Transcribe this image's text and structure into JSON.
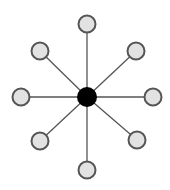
{
  "diagram": {
    "type": "star-network",
    "colors": {
      "background": "#ffffff",
      "edge": "#555555",
      "hub_fill": "#000000",
      "node_fill": "#e2e2e2",
      "node_stroke": "#555555"
    },
    "hub": {
      "id": "hub",
      "x": 87,
      "y": 97,
      "r": 10
    },
    "nodes": [
      {
        "id": "node-top",
        "x": 87,
        "y": 24,
        "r": 8.5
      },
      {
        "id": "node-top-right",
        "x": 136,
        "y": 51,
        "r": 8.5
      },
      {
        "id": "node-right",
        "x": 153,
        "y": 97,
        "r": 8.5
      },
      {
        "id": "node-bottom-right",
        "x": 137,
        "y": 140,
        "r": 8.5
      },
      {
        "id": "node-bottom",
        "x": 87,
        "y": 170,
        "r": 8.5
      },
      {
        "id": "node-bottom-left",
        "x": 40,
        "y": 141,
        "r": 8.5
      },
      {
        "id": "node-left",
        "x": 21,
        "y": 97,
        "r": 8.5
      },
      {
        "id": "node-top-left",
        "x": 40,
        "y": 51,
        "r": 8.5
      }
    ]
  }
}
